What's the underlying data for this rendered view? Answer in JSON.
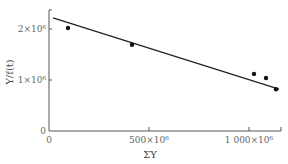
{
  "chart_data": {
    "type": "scatter",
    "title": "",
    "xlabel": "ΣY",
    "ylabel": "Y/f(t)",
    "xlim": [
      0,
      1170000000
    ],
    "ylim": [
      0,
      2400000
    ],
    "grid": false,
    "legend": null,
    "x_ticks": [
      {
        "value": 0,
        "label": "0"
      },
      {
        "value": 500000000,
        "label": "500×10⁶"
      },
      {
        "value": 1000000000,
        "label": "1 000×10⁶"
      }
    ],
    "y_ticks": [
      {
        "value": 0,
        "label": "0"
      },
      {
        "value": 1000000,
        "label": "1×10⁶"
      },
      {
        "value": 2000000,
        "label": "2×10⁶"
      }
    ],
    "series": [
      {
        "name": "observed",
        "type": "scatter",
        "x": [
          95000000,
          415000000,
          1025000000,
          1085000000,
          1135000000
        ],
        "y": [
          2020000,
          1690000,
          1120000,
          1040000,
          820000
        ]
      },
      {
        "name": "fit line",
        "type": "line",
        "x": [
          20000000,
          1150000000
        ],
        "y": [
          2220000,
          820000
        ]
      }
    ]
  }
}
